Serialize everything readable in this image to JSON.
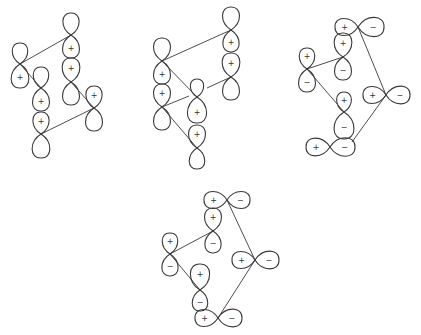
{
  "figure": {
    "width": 421,
    "height": 335,
    "stroke_color": "#3a3a3a",
    "background": "#ffffff"
  },
  "diagrams": [
    {
      "name": "diagram-1",
      "orbitals": [
        {
          "x": 20,
          "y": 64,
          "orient": "v",
          "a": 21,
          "b": 24,
          "sign_a": "",
          "sign_b": "+"
        },
        {
          "x": 71,
          "y": 35,
          "orient": "v",
          "a": 22,
          "b": 23,
          "sign_a": "",
          "sign_b": "+"
        },
        {
          "x": 71,
          "y": 82,
          "orient": "v",
          "a": 24,
          "b": 23,
          "sign_a": "+",
          "sign_b": ""
        },
        {
          "x": 41,
          "y": 88,
          "orient": "v",
          "a": 21,
          "b": 23,
          "sign_a": "",
          "sign_b": "+"
        },
        {
          "x": 41,
          "y": 134,
          "orient": "v",
          "a": 22,
          "b": 24,
          "sign_a": "+",
          "sign_b": ""
        },
        {
          "x": 94,
          "y": 108,
          "orient": "v",
          "a": 22,
          "b": 23,
          "sign_a": "+",
          "sign_b": ""
        }
      ],
      "bonds": [
        [
          20,
          64,
          71,
          35
        ],
        [
          20,
          64,
          41,
          88
        ],
        [
          71,
          82,
          94,
          108
        ],
        [
          41,
          134,
          94,
          108
        ]
      ]
    },
    {
      "name": "diagram-2",
      "orbitals": [
        {
          "x": 162,
          "y": 61,
          "orient": "v",
          "a": 23,
          "b": 23,
          "sign_a": "",
          "sign_b": "+"
        },
        {
          "x": 162,
          "y": 107,
          "orient": "v",
          "a": 23,
          "b": 23,
          "sign_a": "+",
          "sign_b": ""
        },
        {
          "x": 197,
          "y": 97,
          "orient": "v",
          "a": 18,
          "b": 26,
          "sign_a": "",
          "sign_b": "+"
        },
        {
          "x": 197,
          "y": 148,
          "orient": "v",
          "a": 23,
          "b": 21,
          "sign_a": "+",
          "sign_b": ""
        },
        {
          "x": 231,
          "y": 30,
          "orient": "v",
          "a": 23,
          "b": 22,
          "sign_a": "",
          "sign_b": "+"
        },
        {
          "x": 231,
          "y": 77,
          "orient": "v",
          "a": 24,
          "b": 23,
          "sign_a": "+",
          "sign_b": ""
        }
      ],
      "bonds": [
        [
          162,
          61,
          231,
          30
        ],
        [
          162,
          61,
          197,
          97
        ],
        [
          162,
          107,
          189,
          96
        ],
        [
          162,
          107,
          197,
          148
        ],
        [
          207,
          88,
          231,
          77
        ]
      ]
    },
    {
      "name": "diagram-3",
      "orbitals": [
        {
          "x": 358,
          "y": 27,
          "orient": "h",
          "a": 23,
          "b": 26,
          "sign_a": "+",
          "sign_b": "−"
        },
        {
          "x": 343,
          "y": 57,
          "orient": "v",
          "a": 24,
          "b": 23,
          "sign_a": "+",
          "sign_b": "−"
        },
        {
          "x": 307,
          "y": 69,
          "orient": "v",
          "a": 21,
          "b": 23,
          "sign_a": "+",
          "sign_b": "−"
        },
        {
          "x": 386,
          "y": 95,
          "orient": "h",
          "a": 23,
          "b": 24,
          "sign_a": "+",
          "sign_b": "−"
        },
        {
          "x": 344,
          "y": 112,
          "orient": "v",
          "a": 20,
          "b": 27,
          "sign_a": "+",
          "sign_b": "−"
        },
        {
          "x": 330,
          "y": 147,
          "orient": "h",
          "a": 24,
          "b": 25,
          "sign_a": "+",
          "sign_b": "−"
        }
      ],
      "bonds": [
        [
          307,
          69,
          343,
          57
        ],
        [
          358,
          27,
          386,
          95
        ],
        [
          307,
          69,
          344,
          112
        ],
        [
          386,
          95,
          352,
          142
        ]
      ]
    },
    {
      "name": "diagram-4",
      "orbitals": [
        {
          "x": 227,
          "y": 200,
          "orient": "h",
          "a": 23,
          "b": 23,
          "sign_a": "+",
          "sign_b": "−"
        },
        {
          "x": 213,
          "y": 231,
          "orient": "v",
          "a": 23,
          "b": 22,
          "sign_a": "+",
          "sign_b": "−"
        },
        {
          "x": 170,
          "y": 254,
          "orient": "v",
          "a": 21,
          "b": 22,
          "sign_a": "+",
          "sign_b": "−"
        },
        {
          "x": 255,
          "y": 260,
          "orient": "h",
          "a": 23,
          "b": 24,
          "sign_a": "+",
          "sign_b": "−"
        },
        {
          "x": 200,
          "y": 290,
          "orient": "v",
          "a": 26,
          "b": 21,
          "sign_a": "+",
          "sign_b": "−"
        },
        {
          "x": 218,
          "y": 318,
          "orient": "h",
          "a": 23,
          "b": 24,
          "sign_a": "+",
          "sign_b": "−"
        }
      ],
      "bonds": [
        [
          170,
          254,
          213,
          231
        ],
        [
          227,
          200,
          255,
          260
        ],
        [
          170,
          254,
          200,
          290
        ],
        [
          255,
          260,
          218,
          318
        ]
      ]
    }
  ]
}
